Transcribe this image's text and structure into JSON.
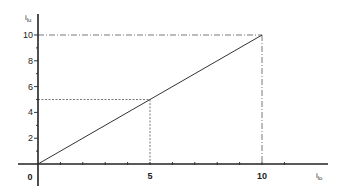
{
  "chart_data": {
    "type": "line",
    "title": "",
    "xlabel": "i_lo",
    "ylabel": "i_lu",
    "xlabel_main": "i",
    "xlabel_sub": "lo",
    "ylabel_main": "i",
    "ylabel_sub": "lu",
    "xlim": [
      0,
      13
    ],
    "ylim": [
      -1.5,
      11.5
    ],
    "x_ticks": [
      1,
      2,
      3,
      4,
      5,
      6,
      7,
      8,
      9,
      10,
      11
    ],
    "x_tick_labels": [
      {
        "value": 5,
        "label": "5"
      },
      {
        "value": 10,
        "label": "10"
      }
    ],
    "y_ticks": [
      1,
      2,
      3,
      4,
      5,
      6,
      7,
      8,
      9,
      10
    ],
    "y_tick_labels": [
      {
        "value": 2,
        "label": "2"
      },
      {
        "value": 4,
        "label": "4"
      },
      {
        "value": 6,
        "label": "6"
      },
      {
        "value": 8,
        "label": "8"
      },
      {
        "value": 10,
        "label": "10"
      }
    ],
    "origin_label": "0",
    "grid": false,
    "series": [
      {
        "name": "i_lu vs i_lo",
        "x": [
          0,
          10
        ],
        "y": [
          0,
          10
        ]
      }
    ],
    "reference_lines": [
      {
        "x": 5,
        "y": 5,
        "style": "dotted"
      },
      {
        "x": 10,
        "y": 10,
        "style": "dash-dot"
      }
    ]
  }
}
